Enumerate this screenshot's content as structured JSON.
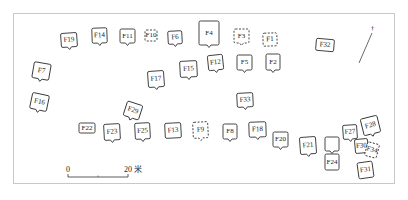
{
  "features": [
    {
      "id": "F19",
      "x": 61,
      "y": 33,
      "w": 16,
      "h": 14,
      "rot": -4,
      "notch": true
    },
    {
      "id": "F14",
      "x": 92,
      "y": 28,
      "w": 15,
      "h": 15,
      "rot": -2,
      "notch": true
    },
    {
      "id": "F11",
      "x": 120,
      "y": 29,
      "w": 15,
      "h": 14,
      "rot": 0,
      "notch": true
    },
    {
      "id": "F10",
      "x": 145,
      "y": 30,
      "w": 12,
      "h": 11,
      "rot": 0,
      "notch": false,
      "dashed": true
    },
    {
      "id": "F6",
      "x": 168,
      "y": 31,
      "w": 14,
      "h": 13,
      "rot": -3,
      "notch": true
    },
    {
      "id": "F4",
      "x": 199,
      "y": 21,
      "w": 20,
      "h": 24,
      "rot": 0,
      "notch": true
    },
    {
      "id": "F3",
      "x": 234,
      "y": 29,
      "w": 15,
      "h": 14,
      "rot": 0,
      "notch": true,
      "dashed": true
    },
    {
      "id": "F1",
      "x": 263,
      "y": 33,
      "w": 14,
      "h": 13,
      "rot": -2,
      "notch": false,
      "dashed": true
    },
    {
      "id": "F32",
      "x": 316,
      "y": 39,
      "w": 18,
      "h": 12,
      "rot": 5,
      "notch": false
    },
    {
      "id": "F7",
      "x": 33,
      "y": 63,
      "w": 17,
      "h": 16,
      "rot": 10,
      "notch": true
    },
    {
      "id": "F12",
      "x": 208,
      "y": 55,
      "w": 15,
      "h": 15,
      "rot": -6,
      "notch": true
    },
    {
      "id": "F5",
      "x": 237,
      "y": 55,
      "w": 15,
      "h": 15,
      "rot": 0,
      "notch": true
    },
    {
      "id": "F2",
      "x": 266,
      "y": 54,
      "w": 14,
      "h": 16,
      "rot": 0,
      "notch": true
    },
    {
      "id": "F15",
      "x": 180,
      "y": 61,
      "w": 17,
      "h": 16,
      "rot": -3,
      "notch": true
    },
    {
      "id": "F17",
      "x": 148,
      "y": 71,
      "w": 16,
      "h": 16,
      "rot": -4,
      "notch": true
    },
    {
      "id": "F16",
      "x": 31,
      "y": 94,
      "w": 17,
      "h": 16,
      "rot": 12,
      "notch": true
    },
    {
      "id": "F33",
      "x": 237,
      "y": 93,
      "w": 16,
      "h": 14,
      "rot": -3,
      "notch": true
    },
    {
      "id": "F29",
      "x": 125,
      "y": 103,
      "w": 16,
      "h": 15,
      "rot": 18,
      "notch": true
    },
    {
      "id": "F22",
      "x": 79,
      "y": 123,
      "w": 16,
      "h": 10,
      "rot": 0,
      "notch": false
    },
    {
      "id": "F23",
      "x": 104,
      "y": 124,
      "w": 16,
      "h": 16,
      "rot": -3,
      "notch": true
    },
    {
      "id": "F25",
      "x": 135,
      "y": 123,
      "w": 15,
      "h": 16,
      "rot": -3,
      "notch": true
    },
    {
      "id": "F13",
      "x": 165,
      "y": 123,
      "w": 16,
      "h": 15,
      "rot": -3,
      "notch": false
    },
    {
      "id": "F9",
      "x": 193,
      "y": 122,
      "w": 15,
      "h": 16,
      "rot": -3,
      "notch": true,
      "dashed": true
    },
    {
      "id": "F8",
      "x": 223,
      "y": 124,
      "w": 14,
      "h": 15,
      "rot": 0,
      "notch": true
    },
    {
      "id": "F18",
      "x": 249,
      "y": 122,
      "w": 17,
      "h": 15,
      "rot": -2,
      "notch": true
    },
    {
      "id": "F20",
      "x": 273,
      "y": 132,
      "w": 15,
      "h": 15,
      "rot": 0,
      "notch": true
    },
    {
      "id": "F21",
      "x": 300,
      "y": 137,
      "w": 16,
      "h": 17,
      "rot": -4,
      "notch": true
    },
    {
      "id": "",
      "x": 325,
      "y": 137,
      "w": 14,
      "h": 14,
      "rot": 0,
      "notch": true
    },
    {
      "id": "F24",
      "x": 325,
      "y": 154,
      "w": 14,
      "h": 16,
      "rot": 0,
      "notch": false
    },
    {
      "id": "F27",
      "x": 343,
      "y": 125,
      "w": 14,
      "h": 14,
      "rot": -4,
      "notch": true
    },
    {
      "id": "F28",
      "x": 362,
      "y": 117,
      "w": 17,
      "h": 17,
      "rot": -14,
      "notch": true
    },
    {
      "id": "F30",
      "x": 355,
      "y": 139,
      "w": 13,
      "h": 14,
      "rot": -5,
      "notch": false
    },
    {
      "id": "F34",
      "x": 366,
      "y": 143,
      "w": 12,
      "h": 14,
      "rot": 15,
      "notch": false,
      "dashed": true
    },
    {
      "id": "F31",
      "x": 358,
      "y": 162,
      "w": 15,
      "h": 16,
      "rot": -8,
      "notch": false
    }
  ],
  "north_arrow": {
    "label": "N",
    "x1": 359,
    "y1": 63,
    "x2": 372,
    "y2": 33
  },
  "scale_bar": {
    "start_label": "0",
    "end_label": "20 米",
    "x": 68,
    "y": 177,
    "length": 60
  }
}
